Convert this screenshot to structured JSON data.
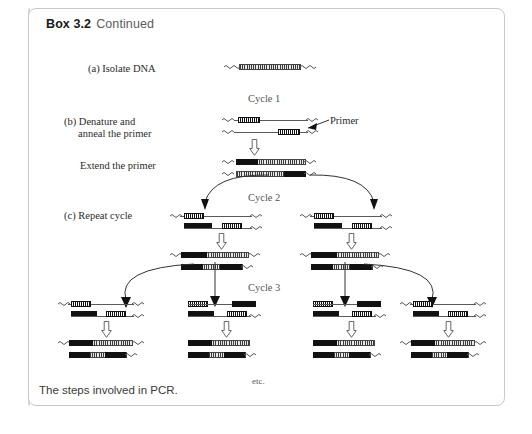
{
  "box": {
    "header_label": "Box 3.2",
    "header_continued": "Continued",
    "caption": "The steps involved in PCR."
  },
  "steps": [
    {
      "id": "a",
      "label": "(a) Isolate DNA"
    },
    {
      "id": "b",
      "label": "(b) Denature and\nanneal the primer"
    },
    {
      "id": "b2",
      "label": "Extend the primer"
    },
    {
      "id": "c",
      "label": "(c) Repeat cycle"
    }
  ],
  "labels": {
    "step_a": "(a) Isolate DNA",
    "step_b_line1": "(b) Denature and",
    "step_b_line2": "anneal the primer",
    "extend": "Extend the primer",
    "step_c": "(c) Repeat cycle",
    "primer": "Primer",
    "etc": "etc."
  },
  "cycles": [
    {
      "name": "Cycle 1"
    },
    {
      "name": "Cycle 2"
    },
    {
      "name": "Cycle 3"
    }
  ],
  "cycle_names": {
    "one": "Cycle 1",
    "two": "Cycle 2",
    "three": "Cycle 3"
  },
  "colors": {
    "box_border": "#c9c9c9",
    "primer_black": "#111111",
    "strand_gray": "#5a5a5a",
    "extension_gray": "#e8e8e8",
    "header_text": "#1a1a1a",
    "caption_text": "#3a3a3a",
    "cycle_text": "#555555"
  },
  "diagram": {
    "type": "pcr-amplification-schematic",
    "product_counts": {
      "cycle1": 1,
      "cycle2": 2,
      "cycle3": 4
    },
    "element_names": [
      "template-duplex",
      "denatured-strand",
      "annealed-primer",
      "extended-strand",
      "down-arrow",
      "branch-arrow"
    ]
  }
}
